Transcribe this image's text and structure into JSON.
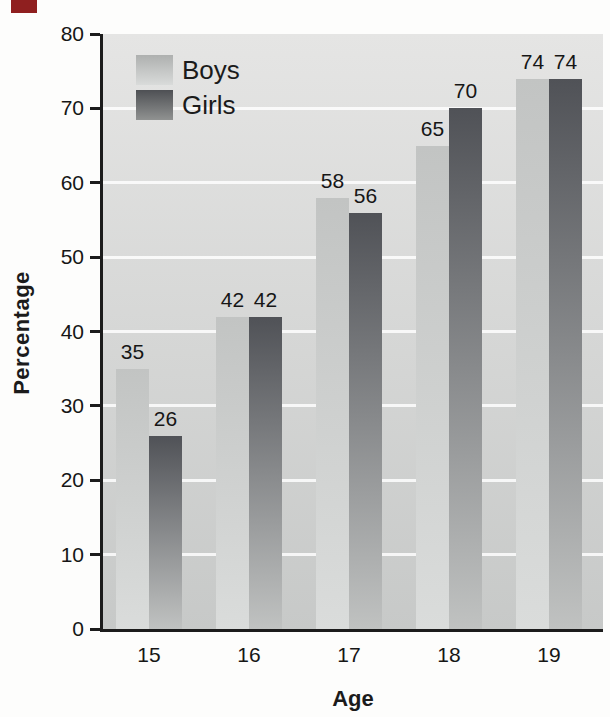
{
  "chart_data": {
    "type": "bar",
    "title": "",
    "xlabel": "Age",
    "ylabel": "Percentage",
    "categories": [
      "15",
      "16",
      "17",
      "18",
      "19"
    ],
    "series": [
      {
        "name": "Boys",
        "values": [
          35,
          42,
          58,
          65,
          74
        ]
      },
      {
        "name": "Girls",
        "values": [
          26,
          42,
          56,
          70,
          74
        ]
      }
    ],
    "ylim": [
      0,
      80
    ],
    "yticks": [
      0,
      10,
      20,
      30,
      40,
      50,
      60,
      70,
      80
    ],
    "grid": true,
    "gridline_color": "#ffffff",
    "legend_position": "top-left",
    "bar_labels": true
  },
  "colors": {
    "plot_bg_top": "#e5e5e4",
    "plot_bg_bottom": "#c7c9c8",
    "boys_bar_top": "#c2c4c3",
    "boys_bar_bottom": "#dadcdb",
    "girls_bar_top": "#505257",
    "girls_bar_bottom": "#c0c2c1",
    "axis": "#1c1c1c",
    "gridline": "#ffffff",
    "red_marker": "#8f1f1f"
  }
}
